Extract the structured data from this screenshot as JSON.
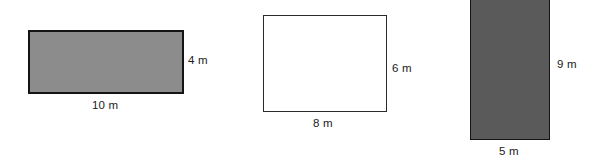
{
  "diagram": {
    "background_color": "#ffffff",
    "unit": "m",
    "figures": [
      {
        "id": "figure-1",
        "shape": "rectangle",
        "fill_color": "#8c8c8c",
        "stroke_color": "#141414",
        "shaded": true,
        "width_label": "10 m",
        "height_label": "4 m",
        "width_value": 10,
        "height_value": 4
      },
      {
        "id": "figure-2",
        "shape": "rectangle",
        "fill_color": "#ffffff",
        "stroke_color": "#2a2a2a",
        "shaded": false,
        "width_label": "8 m",
        "height_label": "6 m",
        "width_value": 8,
        "height_value": 6
      },
      {
        "id": "figure-3",
        "shape": "rectangle",
        "fill_color": "#5a5a5a",
        "stroke_color": "#141414",
        "shaded": true,
        "width_label": "5 m",
        "height_label": "9 m",
        "width_value": 5,
        "height_value": 9
      }
    ]
  }
}
